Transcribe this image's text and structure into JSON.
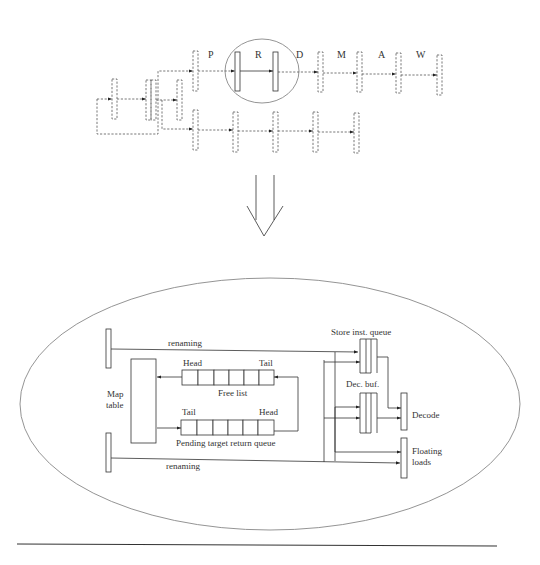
{
  "pipeline": {
    "stages": [
      {
        "label": "P"
      },
      {
        "label": "R"
      },
      {
        "label": "D"
      },
      {
        "label": "M"
      },
      {
        "label": "A"
      },
      {
        "label": "W"
      }
    ],
    "highlighted_stage": "R"
  },
  "transform_arrow": {
    "direction": "down"
  },
  "detail": {
    "renaming_top": "renaming",
    "renaming_bottom": "renaming",
    "map_table": {
      "line1": "Map",
      "line2": "table"
    },
    "free_list": {
      "label": "Free list",
      "head": "Head",
      "tail": "Tail",
      "cells": 6
    },
    "pending_queue": {
      "label": "Pending target return queue",
      "head": "Head",
      "tail": "Tail",
      "cells": 6
    },
    "store_queue": {
      "label": "Store inst. queue"
    },
    "dec_buf": {
      "label": "Dec. buf."
    },
    "decode": {
      "label": "Decode"
    },
    "floating_loads": {
      "line1": "Floating",
      "line2": "loads"
    }
  },
  "colors": {
    "stroke": "#333333",
    "ellipse": "#888888",
    "background": "#ffffff"
  }
}
